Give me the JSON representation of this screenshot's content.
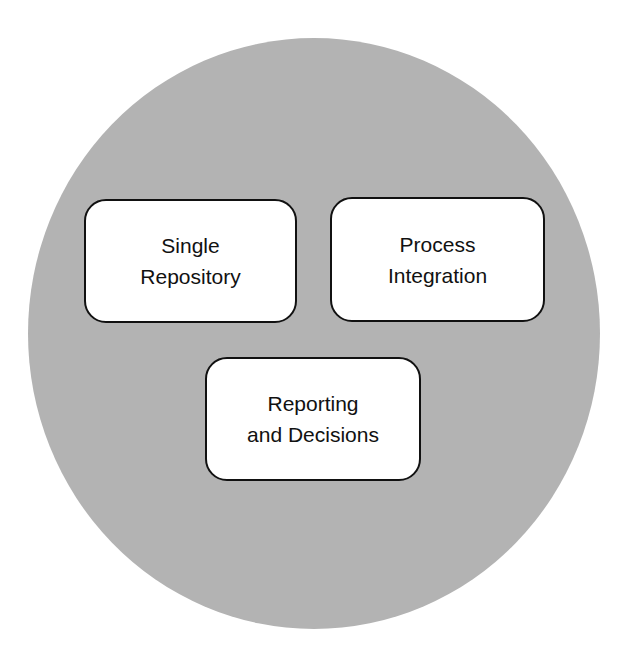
{
  "diagram": {
    "circle_color": "#b3b3b3",
    "boxes": [
      {
        "label": "Single\nRepository"
      },
      {
        "label": "Process\nIntegration"
      },
      {
        "label": "Reporting\nand Decisions"
      }
    ]
  }
}
